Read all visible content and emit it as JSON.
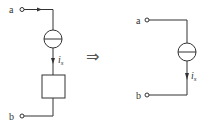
{
  "left_circuit": {
    "terminal_top": "a",
    "terminal_bottom": "b",
    "current_label": "i",
    "current_subscript": "s",
    "elements": [
      "current-source",
      "arbitrary-element"
    ]
  },
  "transform_symbol": "⇒",
  "right_circuit": {
    "terminal_top": "a",
    "terminal_bottom": "b",
    "current_label": "i",
    "current_subscript": "s",
    "elements": [
      "current-source"
    ]
  }
}
